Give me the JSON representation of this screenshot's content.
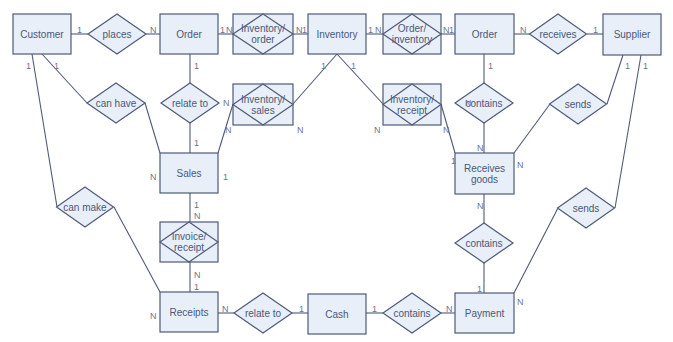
{
  "diagram": {
    "type": "entity-relationship",
    "colors": {
      "fill": "#e8eff8",
      "stroke": "#4f5a78",
      "text": "#4a5878"
    },
    "entities": [
      {
        "id": "customer",
        "label": "Customer",
        "x": 13,
        "y": 14,
        "w": 58,
        "h": 40
      },
      {
        "id": "order_left",
        "label": "Order",
        "x": 160,
        "y": 14,
        "w": 58,
        "h": 40
      },
      {
        "id": "inventory",
        "label": "Inventory",
        "x": 308,
        "y": 14,
        "w": 58,
        "h": 40
      },
      {
        "id": "order_right",
        "label": "Order",
        "x": 455,
        "y": 14,
        "w": 59,
        "h": 40
      },
      {
        "id": "supplier",
        "label": "Supplier",
        "x": 603,
        "y": 14,
        "w": 58,
        "h": 41
      },
      {
        "id": "sales",
        "label": "Sales",
        "x": 160,
        "y": 153,
        "w": 58,
        "h": 40
      },
      {
        "id": "receives_goods",
        "label": [
          "Receives",
          "goods"
        ],
        "x": 455,
        "y": 153,
        "w": 59,
        "h": 41
      },
      {
        "id": "receipts",
        "label": "Receipts",
        "x": 160,
        "y": 292,
        "w": 58,
        "h": 40
      },
      {
        "id": "cash",
        "label": "Cash",
        "x": 308,
        "y": 294,
        "w": 58,
        "h": 40
      },
      {
        "id": "payment",
        "label": "Payment",
        "x": 455,
        "y": 293,
        "w": 59,
        "h": 40
      }
    ],
    "associative_entities": [
      {
        "id": "inventory_order",
        "label": [
          "Inventory/",
          "order"
        ],
        "x": 233,
        "y": 14,
        "w": 60,
        "h": 40
      },
      {
        "id": "order_inventory",
        "label": [
          "Order/",
          "inventory"
        ],
        "x": 383,
        "y": 14,
        "w": 58,
        "h": 40
      },
      {
        "id": "inventory_sales",
        "label": [
          "Inventory/",
          "sales"
        ],
        "x": 233,
        "y": 84,
        "w": 60,
        "h": 41
      },
      {
        "id": "inventory_receipt",
        "label": [
          "Inventory/",
          "receipt"
        ],
        "x": 383,
        "y": 84,
        "w": 58,
        "h": 41
      },
      {
        "id": "invoice_receipt",
        "label": [
          "Invoice/",
          "receipt"
        ],
        "x": 160,
        "y": 222,
        "w": 58,
        "h": 40
      }
    ],
    "relationships": [
      {
        "id": "places",
        "label": "places",
        "cx": 117,
        "cy": 34,
        "w": 58,
        "h": 40
      },
      {
        "id": "receives",
        "label": "receives",
        "cx": 558,
        "cy": 34,
        "w": 57,
        "h": 40
      },
      {
        "id": "can_have",
        "label": "can have",
        "cx": 116,
        "cy": 103,
        "w": 58,
        "h": 40
      },
      {
        "id": "relate_to_top",
        "label": "relate to",
        "cx": 190,
        "cy": 103,
        "w": 58,
        "h": 40
      },
      {
        "id": "contains_top",
        "label": "contains",
        "cx": 484,
        "cy": 103,
        "w": 58,
        "h": 40
      },
      {
        "id": "sends_top",
        "label": "sends",
        "cx": 578,
        "cy": 104,
        "w": 57,
        "h": 40
      },
      {
        "id": "can_make",
        "label": "can make",
        "cx": 85,
        "cy": 207,
        "w": 57,
        "h": 40
      },
      {
        "id": "sends_low",
        "label": "sends",
        "cx": 586,
        "cy": 208,
        "w": 57,
        "h": 40
      },
      {
        "id": "contains_mid",
        "label": "contains",
        "cx": 484,
        "cy": 243,
        "w": 58,
        "h": 40
      },
      {
        "id": "relate_to_bottom",
        "label": "relate to",
        "cx": 263,
        "cy": 313,
        "w": 58,
        "h": 40
      },
      {
        "id": "contains_bottom",
        "label": "contains",
        "cx": 412,
        "cy": 313,
        "w": 58,
        "h": 40
      }
    ],
    "edges": [
      {
        "x1": 71,
        "y1": 34,
        "x2": 88,
        "y2": 34
      },
      {
        "x1": 146,
        "y1": 34,
        "x2": 160,
        "y2": 34
      },
      {
        "x1": 218,
        "y1": 34,
        "x2": 233,
        "y2": 34
      },
      {
        "x1": 293,
        "y1": 34,
        "x2": 308,
        "y2": 34
      },
      {
        "x1": 366,
        "y1": 34,
        "x2": 383,
        "y2": 34
      },
      {
        "x1": 441,
        "y1": 34,
        "x2": 455,
        "y2": 34
      },
      {
        "x1": 514,
        "y1": 34,
        "x2": 530,
        "y2": 34
      },
      {
        "x1": 587,
        "y1": 34,
        "x2": 603,
        "y2": 34
      },
      {
        "x1": 42,
        "y1": 54,
        "x2": 87,
        "y2": 103
      },
      {
        "x1": 145,
        "y1": 103,
        "x2": 160,
        "y2": 153
      },
      {
        "x1": 32,
        "y1": 54,
        "x2": 57,
        "y2": 207
      },
      {
        "x1": 114,
        "y1": 207,
        "x2": 160,
        "y2": 292
      },
      {
        "x1": 190,
        "y1": 54,
        "x2": 190,
        "y2": 83
      },
      {
        "x1": 190,
        "y1": 123,
        "x2": 190,
        "y2": 153
      },
      {
        "x1": 337,
        "y1": 54,
        "x2": 293,
        "y2": 104
      },
      {
        "x1": 233,
        "y1": 104,
        "x2": 218,
        "y2": 153
      },
      {
        "x1": 337,
        "y1": 54,
        "x2": 383,
        "y2": 104
      },
      {
        "x1": 441,
        "y1": 104,
        "x2": 455,
        "y2": 153
      },
      {
        "x1": 484,
        "y1": 54,
        "x2": 484,
        "y2": 83
      },
      {
        "x1": 484,
        "y1": 123,
        "x2": 484,
        "y2": 153
      },
      {
        "x1": 623,
        "y1": 55,
        "x2": 607,
        "y2": 104
      },
      {
        "x1": 550,
        "y1": 104,
        "x2": 514,
        "y2": 153
      },
      {
        "x1": 641,
        "y1": 55,
        "x2": 615,
        "y2": 208
      },
      {
        "x1": 558,
        "y1": 208,
        "x2": 514,
        "y2": 293
      },
      {
        "x1": 190,
        "y1": 193,
        "x2": 190,
        "y2": 222
      },
      {
        "x1": 190,
        "y1": 262,
        "x2": 190,
        "y2": 292
      },
      {
        "x1": 484,
        "y1": 194,
        "x2": 484,
        "y2": 223
      },
      {
        "x1": 484,
        "y1": 263,
        "x2": 484,
        "y2": 293
      },
      {
        "x1": 218,
        "y1": 313,
        "x2": 234,
        "y2": 313
      },
      {
        "x1": 292,
        "y1": 313,
        "x2": 308,
        "y2": 313
      },
      {
        "x1": 366,
        "y1": 313,
        "x2": 383,
        "y2": 313
      },
      {
        "x1": 441,
        "y1": 313,
        "x2": 455,
        "y2": 313
      }
    ],
    "cardinalities": [
      {
        "t": "1",
        "x": 77,
        "y": 30
      },
      {
        "t": "N",
        "x": 150,
        "y": 30
      },
      {
        "t": "1",
        "x": 220,
        "y": 30
      },
      {
        "t": "N",
        "x": 226,
        "y": 30
      },
      {
        "t": "N",
        "x": 296,
        "y": 30
      },
      {
        "t": "1",
        "x": 302,
        "y": 30
      },
      {
        "t": "1",
        "x": 368,
        "y": 30
      },
      {
        "t": "N",
        "x": 375,
        "y": 30
      },
      {
        "t": "N",
        "x": 443,
        "y": 30
      },
      {
        "t": "1",
        "x": 449,
        "y": 30
      },
      {
        "t": "N",
        "x": 520,
        "y": 30
      },
      {
        "t": "1",
        "x": 593,
        "y": 30
      },
      {
        "t": "1",
        "x": 26,
        "y": 66
      },
      {
        "t": "1",
        "x": 54,
        "y": 66
      },
      {
        "t": "1",
        "x": 194,
        "y": 66
      },
      {
        "t": "N",
        "x": 223,
        "y": 103
      },
      {
        "t": "1",
        "x": 321,
        "y": 66
      },
      {
        "t": "1",
        "x": 351,
        "y": 66
      },
      {
        "t": "N",
        "x": 225,
        "y": 130
      },
      {
        "t": "N",
        "x": 297,
        "y": 130
      },
      {
        "t": "N",
        "x": 374,
        "y": 130
      },
      {
        "t": "N",
        "x": 443,
        "y": 130
      },
      {
        "t": "1",
        "x": 488,
        "y": 66
      },
      {
        "t": "N",
        "x": 465,
        "y": 103
      },
      {
        "t": "1",
        "x": 625,
        "y": 66
      },
      {
        "t": "1",
        "x": 643,
        "y": 66
      },
      {
        "t": "1",
        "x": 194,
        "y": 143
      },
      {
        "t": "N",
        "x": 150,
        "y": 177
      },
      {
        "t": "1",
        "x": 223,
        "y": 177
      },
      {
        "t": "N",
        "x": 477,
        "y": 148
      },
      {
        "t": "1",
        "x": 451,
        "y": 161
      },
      {
        "t": "N",
        "x": 517,
        "y": 165
      },
      {
        "t": "1",
        "x": 194,
        "y": 205
      },
      {
        "t": "N",
        "x": 194,
        "y": 216
      },
      {
        "t": "N",
        "x": 477,
        "y": 206
      },
      {
        "t": "N",
        "x": 194,
        "y": 275
      },
      {
        "t": "1",
        "x": 194,
        "y": 287
      },
      {
        "t": "N",
        "x": 150,
        "y": 316
      },
      {
        "t": "N",
        "x": 222,
        "y": 309
      },
      {
        "t": "1",
        "x": 299,
        "y": 309
      },
      {
        "t": "1",
        "x": 372,
        "y": 309
      },
      {
        "t": "N",
        "x": 446,
        "y": 309
      },
      {
        "t": "1",
        "x": 477,
        "y": 289
      },
      {
        "t": "N",
        "x": 517,
        "y": 302
      }
    ]
  }
}
